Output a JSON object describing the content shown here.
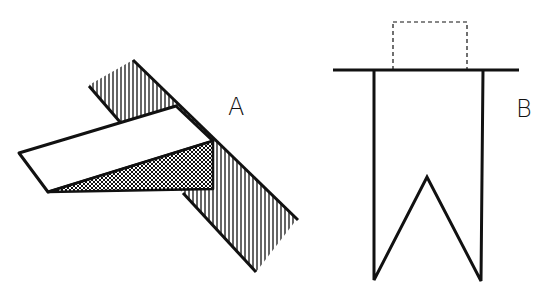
{
  "figures": [
    {
      "id": "A",
      "label": "A",
      "description": "Hatched strip with white bar and cross-hatched triangular shadow"
    },
    {
      "id": "B",
      "label": "B",
      "description": "Rectangular strip with V notch hanging from horizontal line, dashed box above"
    }
  ],
  "colors": {
    "ink": "#111111",
    "background": "#ffffff"
  }
}
